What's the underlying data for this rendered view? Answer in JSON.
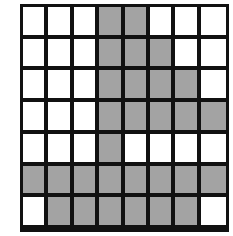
{
  "figure": {
    "rows": 8,
    "cols": 8,
    "fill_color": "#a3a3a3",
    "empty_color": "#ffffff",
    "line_color": "#111111",
    "background_color": "#ffffff"
  },
  "chart_data": {
    "type": "heatmap",
    "title": "",
    "subtitle": "",
    "xlabel": "",
    "ylabel": "",
    "rows": 8,
    "cols": 8,
    "legend": [
      {
        "label": "filled",
        "value": 1,
        "color": "#a3a3a3"
      },
      {
        "label": "empty",
        "value": 0,
        "color": "#ffffff"
      }
    ],
    "row_labels": [
      "1",
      "2",
      "3",
      "4",
      "5",
      "6",
      "7",
      "8"
    ],
    "col_labels": [
      "1",
      "2",
      "3",
      "4",
      "5",
      "6",
      "7",
      "8"
    ],
    "grid": true,
    "values": [
      [
        0,
        0,
        0,
        1,
        1,
        0,
        0,
        0
      ],
      [
        0,
        0,
        0,
        1,
        1,
        1,
        0,
        0
      ],
      [
        0,
        0,
        0,
        1,
        1,
        1,
        1,
        0
      ],
      [
        0,
        0,
        0,
        1,
        1,
        1,
        1,
        1
      ],
      [
        0,
        0,
        0,
        1,
        0,
        0,
        0,
        0
      ],
      [
        1,
        1,
        1,
        1,
        1,
        1,
        1,
        1
      ],
      [
        0,
        1,
        1,
        1,
        1,
        1,
        1,
        0
      ],
      [
        0,
        0,
        1,
        1,
        1,
        1,
        0,
        0
      ]
    ],
    "filled_count": 35,
    "empty_count": 29,
    "total_cells": 64
  }
}
